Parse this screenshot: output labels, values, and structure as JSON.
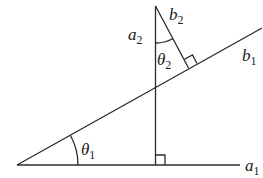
{
  "diagram": {
    "title": "",
    "colors": {
      "stroke": "#2a2a2a",
      "text": "#1a1a1a",
      "background": "#ffffff"
    },
    "labels": {
      "a1": {
        "base": "a",
        "sub": "1"
      },
      "b1": {
        "base": "b",
        "sub": "1"
      },
      "a2": {
        "base": "a",
        "sub": "2"
      },
      "b2": {
        "base": "b",
        "sub": "2"
      },
      "theta1": {
        "base": "θ",
        "sub": "1"
      },
      "theta2": {
        "base": "θ",
        "sub": "2"
      }
    },
    "elements": [
      "horizontal line a1",
      "inclined line b1 through origin at angle theta1",
      "vertical line a2 perpendicular to a1",
      "line b2 perpendicular to b1",
      "right-angle marker at a1/a2 intersection",
      "right-angle marker at b1/b2 intersection",
      "angle arc theta1 between a1 and b1",
      "angle arc theta2 between a2 and b2"
    ]
  }
}
